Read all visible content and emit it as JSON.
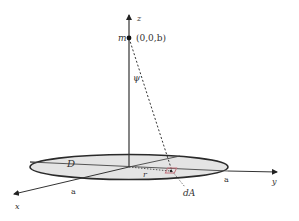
{
  "diagram": {
    "type": "3d-geometry",
    "labels": {
      "z_axis": "z",
      "x_axis": "x",
      "y_axis": "y",
      "mass": "m",
      "mass_coords": "(0,0,b)",
      "angle": "ψ",
      "region": "D",
      "radius_r": "r",
      "area_element": "dA",
      "radius_x": "a",
      "radius_y": "a"
    },
    "colors": {
      "disk_fill": "#e4e4e4",
      "outline": "#2a2a2a",
      "area_element": "#c0707a"
    }
  }
}
